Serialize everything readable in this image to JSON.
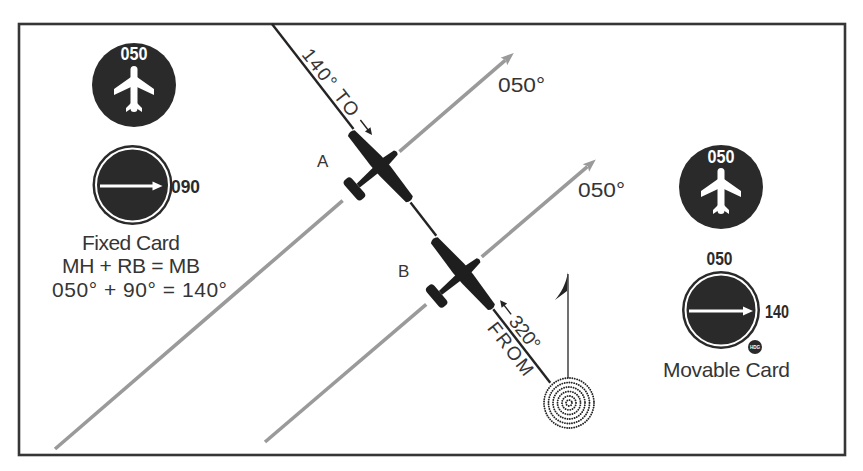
{
  "diagram": {
    "left_panel": {
      "heading_indicator": {
        "heading": "050"
      },
      "adf_indicator": {
        "pointer_value": "090"
      },
      "caption": {
        "title": "Fixed Card",
        "formula": "MH + RB = MB",
        "calculation": "050° + 90° = 140°"
      }
    },
    "right_panel": {
      "heading_indicator": {
        "heading": "050"
      },
      "adf_indicator": {
        "card_top_value": "050",
        "pointer_value": "140",
        "knob_label": "HDG"
      },
      "caption": {
        "title": "Movable Card"
      }
    },
    "course_lines": [
      {
        "label": "050°"
      },
      {
        "label": "050°"
      }
    ],
    "bearing_line": {
      "to_label": "140° TO",
      "from_bearing": "320°",
      "from_label": "FROM"
    },
    "aircraft": [
      {
        "label": "A"
      },
      {
        "label": "B"
      }
    ],
    "icons": [
      "airplane-icon",
      "arrow-right-icon",
      "arrow-left-icon",
      "arrowhead-icon",
      "ndb-station-icon",
      "north-arrow-icon",
      "hdg-knob-icon"
    ]
  },
  "colors": {
    "background": "#ffffff",
    "frame": "#363636",
    "instrument": "#2a2a2a",
    "aircraft": "#1e1e1e",
    "course_line": "#9a9a9a",
    "bearing_line": "#242424",
    "text": "#353535"
  }
}
